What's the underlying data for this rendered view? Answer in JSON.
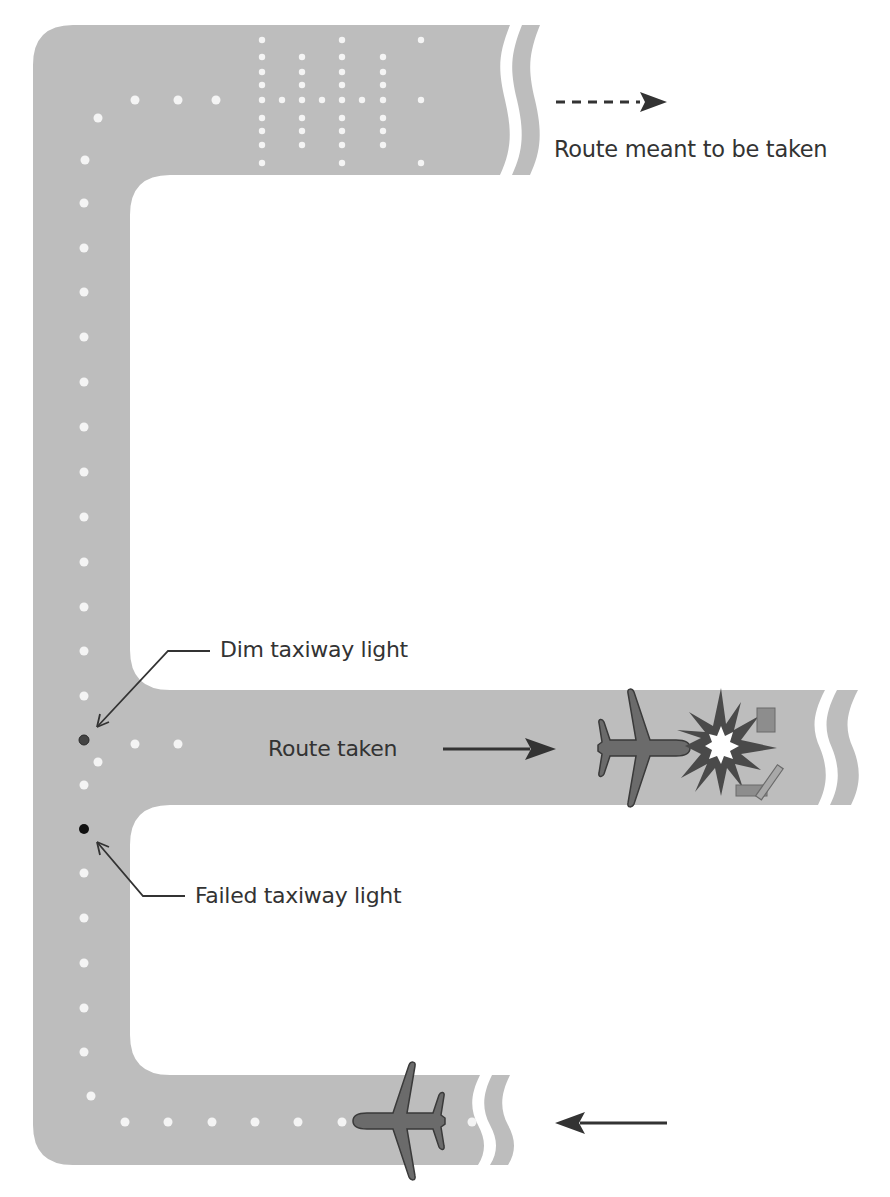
{
  "colors": {
    "pavement": "#bdbdbd",
    "light_on": "#f4f4f4",
    "light_dim": "#444444",
    "light_failed": "#111111",
    "aircraft": "#6b6b6b",
    "aircraft_outline": "#3a3a3a",
    "arrow": "#333333",
    "text": "#333333",
    "background": "#ffffff"
  },
  "legend": {
    "dashed_arrow_label": "Route meant to be taken"
  },
  "annotations": {
    "dim_light": "Dim taxiway light",
    "failed_light": "Failed taxiway light",
    "route_taken": "Route taken"
  },
  "icons": {
    "upper_aircraft": "airplane-icon",
    "lower_aircraft": "airplane-icon",
    "collision": "explosion-icon",
    "debris": "debris-icon"
  }
}
